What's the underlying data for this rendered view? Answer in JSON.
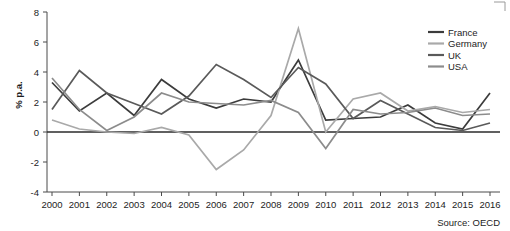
{
  "chart_data": {
    "type": "line",
    "title": "",
    "xlabel": "",
    "ylabel": "% p.a.",
    "ylim": [
      -4,
      8
    ],
    "yticks": [
      8,
      6,
      4,
      2,
      0,
      -2,
      -4
    ],
    "grid": false,
    "legend_position": "top-right",
    "source": "Source: OECD",
    "x": [
      2000,
      2001,
      2002,
      2003,
      2004,
      2005,
      2006,
      2007,
      2008,
      2009,
      2010,
      2011,
      2012,
      2013,
      2014,
      2015,
      2016
    ],
    "categories": [
      "2000",
      "2001",
      "2002",
      "2003",
      "2004",
      "2005",
      "2006",
      "2007",
      "2008",
      "2009",
      "2010",
      "2011",
      "2012",
      "2013",
      "2014",
      "2015",
      "2016"
    ],
    "series": [
      {
        "name": "France",
        "color": "#3c3c3c",
        "values": [
          3.3,
          1.4,
          2.6,
          1.1,
          3.5,
          2.2,
          1.6,
          2.2,
          2.0,
          4.8,
          0.8,
          0.9,
          1.0,
          1.8,
          0.6,
          0.2,
          2.6
        ]
      },
      {
        "name": "Germany",
        "color": "#a9a9a9",
        "values": [
          0.8,
          0.2,
          0.0,
          -0.1,
          0.3,
          -0.2,
          -2.5,
          -1.2,
          1.1,
          6.9,
          0.0,
          2.2,
          2.6,
          1.4,
          1.7,
          1.3,
          1.5
        ]
      },
      {
        "name": "UK",
        "color": "#5a5a5a",
        "values": [
          1.5,
          4.1,
          2.6,
          1.9,
          1.2,
          2.4,
          4.5,
          3.5,
          2.3,
          4.3,
          3.2,
          0.9,
          2.1,
          1.2,
          0.3,
          0.1,
          0.6
        ]
      },
      {
        "name": "USA",
        "color": "#8c8c8c",
        "values": [
          3.6,
          1.5,
          0.1,
          1.0,
          2.6,
          2.0,
          1.9,
          1.8,
          2.1,
          1.3,
          -1.1,
          1.5,
          1.2,
          1.3,
          1.6,
          1.1,
          1.2
        ]
      }
    ]
  },
  "legend": {
    "items": [
      {
        "label": "France"
      },
      {
        "label": "Germany"
      },
      {
        "label": "UK"
      },
      {
        "label": "USA"
      }
    ]
  },
  "axes": {
    "y_title": "% p.a.",
    "y_labels": [
      "8",
      "6",
      "4",
      "2",
      "0",
      "-2",
      "-4"
    ],
    "x_labels": [
      "2000",
      "2001",
      "2002",
      "2003",
      "2004",
      "2005",
      "2006",
      "2007",
      "2008",
      "2009",
      "2010",
      "2011",
      "2012",
      "2013",
      "2014",
      "2015",
      "2016"
    ]
  },
  "footer": {
    "source": "Source: OECD"
  }
}
